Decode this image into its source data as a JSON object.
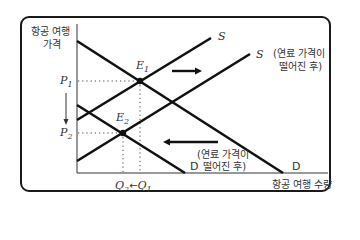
{
  "axes": {
    "y_label_line1": "항공 여행",
    "y_label_line2": "가격",
    "x_label": "항공 여행 수량"
  },
  "price_labels": {
    "p1": "P",
    "p1_sub": "1",
    "p2": "P",
    "p2_sub": "2"
  },
  "quantity_labels": {
    "q2": "Q",
    "q2_sub": "2",
    "arrow": "←",
    "q1": "Q",
    "q1_sub": "1"
  },
  "equilibria": {
    "e1": "E",
    "e1_sub": "1",
    "e2": "E",
    "e2_sub": "2"
  },
  "curves": {
    "s_original": "S",
    "s_after": "S",
    "s_after_note_line1": "(연료 가격이",
    "s_after_note_line2": "떨어진 후)",
    "d_original": "D",
    "d_after": "D",
    "d_after_note_line1": "(연료 가격이",
    "d_after_note_line2": "떨어진 후)"
  }
}
